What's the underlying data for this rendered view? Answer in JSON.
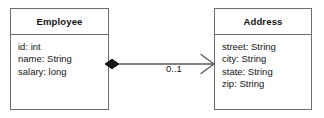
{
  "diagram": {
    "type": "uml-class-diagram",
    "background_color": "#ffffff",
    "line_color": "#5a5a5a",
    "border_color": "#6e6e6e",
    "text_color": "#141414",
    "classes": [
      {
        "name": "Employee",
        "attributes": [
          "id: int",
          "name: String",
          "salary: long"
        ]
      },
      {
        "name": "Address",
        "attributes": [
          "street: String",
          "city: String",
          "state: String",
          "zip: String"
        ]
      }
    ],
    "association": {
      "source": "Employee",
      "target": "Address",
      "source_decoration": "filled-diamond",
      "target_decoration": "open-arrow",
      "multiplicity": "0..1"
    }
  }
}
